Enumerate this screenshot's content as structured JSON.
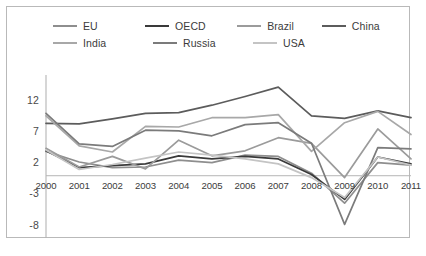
{
  "chart_data": {
    "type": "line",
    "title": "",
    "xlabel": "",
    "ylabel": "",
    "x": [
      2000,
      2001,
      2002,
      2003,
      2004,
      2005,
      2006,
      2007,
      2008,
      2009,
      2010,
      2011
    ],
    "categories": [
      "2000",
      "2001",
      "2002",
      "2003",
      "2004",
      "2005",
      "2006",
      "2007",
      "2008",
      "2009",
      "2010",
      "2011"
    ],
    "ylim": [
      -9.5,
      15.5
    ],
    "xlim": [
      2000,
      2011
    ],
    "yticks": [
      12,
      7,
      2,
      -3,
      -8
    ],
    "ytick_labels": [
      "12",
      "7",
      "2",
      "-3",
      "-8"
    ],
    "grid": false,
    "zero_line": true,
    "legend_position": "top",
    "series": [
      {
        "name": "EU",
        "color": "#8e8e8e",
        "values": [
          3.9,
          2.2,
          1.3,
          1.4,
          2.5,
          2.1,
          3.3,
          3.1,
          0.4,
          -4.4,
          2.1,
          1.7
        ]
      },
      {
        "name": "OECD",
        "color": "#3a3a3a",
        "values": [
          4.0,
          1.3,
          1.6,
          1.9,
          3.2,
          2.7,
          3.1,
          2.7,
          0.2,
          -3.8,
          3.0,
          1.9
        ]
      },
      {
        "name": "Brazil",
        "color": "#9b9b9b",
        "values": [
          4.4,
          1.4,
          3.1,
          1.1,
          5.7,
          3.2,
          4.0,
          6.1,
          5.2,
          -0.3,
          7.5,
          2.7
        ]
      },
      {
        "name": "China",
        "color": "#5c5c5c",
        "values": [
          8.4,
          8.3,
          9.1,
          10.0,
          10.1,
          11.3,
          12.7,
          14.2,
          9.6,
          9.2,
          10.4,
          9.3
        ]
      },
      {
        "name": "India",
        "color": "#a8a8a8",
        "values": [
          9.6,
          4.8,
          3.8,
          7.9,
          7.8,
          9.3,
          9.3,
          9.8,
          3.9,
          8.5,
          10.3,
          6.6
        ]
      },
      {
        "name": "Russia",
        "color": "#7b7b7b",
        "values": [
          10.0,
          5.1,
          4.7,
          7.3,
          7.2,
          6.4,
          8.2,
          8.5,
          5.2,
          -7.8,
          4.5,
          4.3
        ]
      },
      {
        "name": "USA",
        "color": "#c4c4c4",
        "values": [
          4.1,
          1.0,
          1.8,
          2.8,
          3.8,
          3.3,
          2.7,
          1.9,
          -0.3,
          -3.5,
          3.0,
          1.7
        ]
      }
    ]
  },
  "legend": {
    "rows": [
      [
        {
          "label": "EU",
          "series": "EU"
        },
        {
          "label": "OECD",
          "series": "OECD"
        },
        {
          "label": "Brazil",
          "series": "Brazil"
        },
        {
          "label": "China",
          "series": "China"
        }
      ],
      [
        {
          "label": "India",
          "series": "India"
        },
        {
          "label": "Russia",
          "series": "Russia"
        },
        {
          "label": "USA",
          "series": "USA"
        }
      ]
    ]
  },
  "style": {
    "axis_color": "#b5b5b5",
    "frame_color": "#b9b9b9",
    "text_color": "#3b3b3b",
    "background": "#ffffff"
  }
}
